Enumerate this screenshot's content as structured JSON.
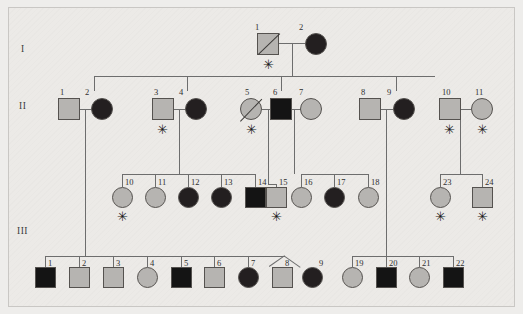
{
  "figure": {
    "type": "pedigree-chart",
    "background_color": "#eceae7",
    "symbol_colors": {
      "unaffected": "#b6b4b1",
      "affected": "#231f20",
      "line": "#6d6d6d",
      "text": "#2f2f2f"
    },
    "legend_notes": {
      "square": "male",
      "circle": "female",
      "filled": "affected",
      "slash": "deceased",
      "asterisk": "sampled/tested"
    }
  },
  "generations": [
    {
      "id": "gen-1",
      "label": "I"
    },
    {
      "id": "gen-2",
      "label": "II"
    },
    {
      "id": "gen-3",
      "label": "III"
    }
  ],
  "individuals": {
    "I": [
      {
        "num": "1",
        "sex": "male",
        "shape": "square",
        "affected": false,
        "deceased": true,
        "asterisk": true
      },
      {
        "num": "2",
        "sex": "female",
        "shape": "circle",
        "affected": true,
        "deceased": false,
        "asterisk": false
      }
    ],
    "II": [
      {
        "num": "1",
        "sex": "male",
        "shape": "square",
        "affected": false,
        "deceased": false,
        "asterisk": false
      },
      {
        "num": "2",
        "sex": "female",
        "shape": "circle",
        "affected": true,
        "deceased": false,
        "asterisk": false
      },
      {
        "num": "3",
        "sex": "male",
        "shape": "square",
        "affected": false,
        "deceased": false,
        "asterisk": true
      },
      {
        "num": "4",
        "sex": "female",
        "shape": "circle",
        "affected": true,
        "deceased": false,
        "asterisk": false
      },
      {
        "num": "5",
        "sex": "female",
        "shape": "circle",
        "affected": false,
        "deceased": true,
        "asterisk": true
      },
      {
        "num": "6",
        "sex": "male",
        "shape": "square",
        "affected": true,
        "deceased": false,
        "asterisk": false
      },
      {
        "num": "7",
        "sex": "female",
        "shape": "circle",
        "affected": false,
        "deceased": false,
        "asterisk": false
      },
      {
        "num": "8",
        "sex": "male",
        "shape": "square",
        "affected": false,
        "deceased": false,
        "asterisk": false
      },
      {
        "num": "9",
        "sex": "female",
        "shape": "circle",
        "affected": true,
        "deceased": false,
        "asterisk": false
      },
      {
        "num": "10",
        "sex": "male",
        "shape": "square",
        "affected": false,
        "deceased": false,
        "asterisk": true
      },
      {
        "num": "11",
        "sex": "female",
        "shape": "circle",
        "affected": false,
        "deceased": false,
        "asterisk": true
      }
    ],
    "III": [
      {
        "num": "1",
        "sex": "male",
        "shape": "square",
        "affected": true,
        "deceased": false,
        "asterisk": false
      },
      {
        "num": "2",
        "sex": "male",
        "shape": "square",
        "affected": false,
        "deceased": false,
        "asterisk": false
      },
      {
        "num": "3",
        "sex": "male",
        "shape": "square",
        "affected": false,
        "deceased": false,
        "asterisk": false
      },
      {
        "num": "4",
        "sex": "female",
        "shape": "circle",
        "affected": false,
        "deceased": false,
        "asterisk": false
      },
      {
        "num": "5",
        "sex": "male",
        "shape": "square",
        "affected": true,
        "deceased": false,
        "asterisk": false
      },
      {
        "num": "6",
        "sex": "male",
        "shape": "square",
        "affected": false,
        "deceased": false,
        "asterisk": false
      },
      {
        "num": "7",
        "sex": "female",
        "shape": "circle",
        "affected": true,
        "deceased": false,
        "asterisk": false
      },
      {
        "num": "8",
        "sex": "male",
        "shape": "square",
        "affected": false,
        "deceased": false,
        "asterisk": false
      },
      {
        "num": "9",
        "sex": "female",
        "shape": "circle",
        "affected": true,
        "deceased": false,
        "asterisk": false
      },
      {
        "num": "10",
        "sex": "female",
        "shape": "circle",
        "affected": false,
        "deceased": false,
        "asterisk": true
      },
      {
        "num": "11",
        "sex": "female",
        "shape": "circle",
        "affected": false,
        "deceased": false,
        "asterisk": false
      },
      {
        "num": "12",
        "sex": "female",
        "shape": "circle",
        "affected": true,
        "deceased": false,
        "asterisk": false
      },
      {
        "num": "13",
        "sex": "female",
        "shape": "circle",
        "affected": true,
        "deceased": false,
        "asterisk": false
      },
      {
        "num": "14",
        "sex": "male",
        "shape": "square",
        "affected": true,
        "deceased": false,
        "asterisk": false
      },
      {
        "num": "15",
        "sex": "male",
        "shape": "square",
        "affected": false,
        "deceased": false,
        "asterisk": true
      },
      {
        "num": "16",
        "sex": "female",
        "shape": "circle",
        "affected": false,
        "deceased": false,
        "asterisk": false
      },
      {
        "num": "17",
        "sex": "female",
        "shape": "circle",
        "affected": true,
        "deceased": false,
        "asterisk": false
      },
      {
        "num": "18",
        "sex": "female",
        "shape": "circle",
        "affected": false,
        "deceased": false,
        "asterisk": false
      },
      {
        "num": "19",
        "sex": "female",
        "shape": "circle",
        "affected": false,
        "deceased": false,
        "asterisk": false
      },
      {
        "num": "20",
        "sex": "male",
        "shape": "square",
        "affected": true,
        "deceased": false,
        "asterisk": false
      },
      {
        "num": "21",
        "sex": "female",
        "shape": "circle",
        "affected": false,
        "deceased": false,
        "asterisk": false
      },
      {
        "num": "22",
        "sex": "male",
        "shape": "square",
        "affected": true,
        "deceased": false,
        "asterisk": false
      },
      {
        "num": "23",
        "sex": "female",
        "shape": "circle",
        "affected": false,
        "deceased": false,
        "asterisk": true
      },
      {
        "num": "24",
        "sex": "male",
        "shape": "square",
        "affected": false,
        "deceased": false,
        "asterisk": true
      }
    ]
  }
}
